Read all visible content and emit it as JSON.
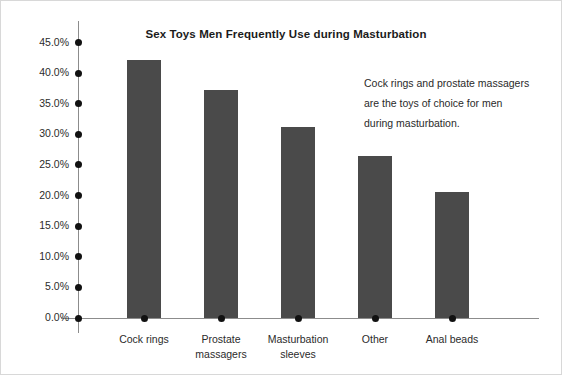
{
  "chart_data": {
    "type": "bar",
    "title": "Sex Toys Men Frequently Use during Masturbation",
    "xlabel": "",
    "ylabel": "",
    "categories": [
      "Cock rings",
      "Prostate massagers",
      "Masturbation sleeves",
      "Other",
      "Anal beads"
    ],
    "values": [
      42.2,
      37.3,
      31.2,
      26.5,
      20.6
    ],
    "value_labels": [
      "42.2%",
      "37.3%",
      "31.2%",
      "26.5%",
      "20.6%"
    ],
    "ylim": [
      0,
      45
    ],
    "ytick_labels": [
      "45.0%",
      "40.0%",
      "35.0%",
      "30.0%",
      "25.0%",
      "20.0%",
      "15.0%",
      "10.0%",
      "5.0%",
      "0.0%"
    ],
    "ytick_values": [
      45,
      40,
      35,
      30,
      25,
      20,
      15,
      10,
      5,
      0
    ],
    "grid": false,
    "legend": false,
    "bar_color": "#4a4a4a",
    "axis_color": "#8c8c8c",
    "text_color": "#2b2b2b"
  },
  "annotation": {
    "line1": "Cock rings and prostate massagers",
    "line2": "are the toys of choice for men",
    "line3": "during masturbation."
  },
  "category_lines": [
    [
      "Cock rings"
    ],
    [
      "Prostate",
      "massagers"
    ],
    [
      "Masturbation",
      "sleeves"
    ],
    [
      "Other"
    ],
    [
      "Anal beads"
    ]
  ]
}
